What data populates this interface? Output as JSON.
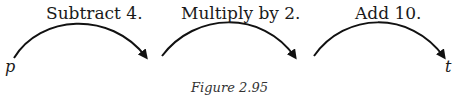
{
  "diagram": {
    "steps": [
      {
        "label": "Subtract 4."
      },
      {
        "label": "Multiply by 2."
      },
      {
        "label": "Add 10."
      }
    ],
    "start_variable": "p",
    "end_variable": "t",
    "caption": "Figure 2.95"
  }
}
